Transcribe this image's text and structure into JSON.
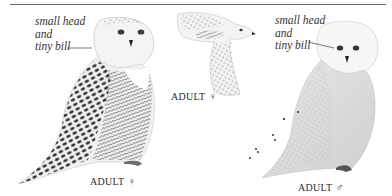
{
  "illustration": {
    "subject": "Snowy Owl",
    "annotations": [
      {
        "id": "left",
        "lines": [
          "small head",
          "and",
          "tiny bill"
        ]
      },
      {
        "id": "right",
        "lines": [
          "small head",
          "and",
          "tiny bill"
        ]
      }
    ],
    "captions": [
      {
        "id": "perched-female",
        "label": "ADULT",
        "symbol": "♀"
      },
      {
        "id": "flying-female",
        "label": "ADULT",
        "symbol": "♀"
      },
      {
        "id": "perched-male",
        "label": "ADULT",
        "symbol": "♂"
      }
    ],
    "colors": {
      "rule": "#6a6a6a",
      "text": "#2b2b2b",
      "barring": "#1e1e1e",
      "plumage": "#f4f4f2",
      "shadow": "#c9c9c9"
    }
  }
}
